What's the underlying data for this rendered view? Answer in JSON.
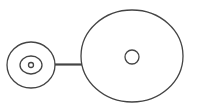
{
  "diagram": {
    "stroke_color": "#444444",
    "background": "#ffffff",
    "nodes": [
      {
        "id": "left-node",
        "shape": "ellipse",
        "cx": 31,
        "cy": 65,
        "rx": 24,
        "ry": 23,
        "children": [
          {
            "id": "left-inner-ring",
            "shape": "ellipse",
            "cx": 31,
            "cy": 65,
            "rx": 11,
            "ry": 9
          },
          {
            "id": "left-center-dot",
            "shape": "circle",
            "cx": 31,
            "cy": 65,
            "r": 2.5
          }
        ]
      },
      {
        "id": "right-node",
        "shape": "ellipse",
        "cx": 132,
        "cy": 56,
        "rx": 51,
        "ry": 46,
        "children": [
          {
            "id": "right-center-circle",
            "shape": "circle",
            "cx": 132,
            "cy": 57,
            "r": 7
          }
        ]
      }
    ],
    "edges": [
      {
        "id": "connector",
        "from": "left-node",
        "to": "right-node",
        "x1": 55,
        "y1": 64.5,
        "x2": 82,
        "y2": 64.5,
        "width": 2.2
      }
    ]
  }
}
